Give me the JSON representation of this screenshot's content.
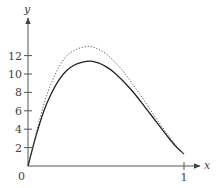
{
  "chart_data": {
    "type": "line",
    "title": "",
    "xlabel": "x",
    "ylabel": "y",
    "xlim": [
      0,
      1.1
    ],
    "ylim": [
      0,
      14
    ],
    "x_ticks": [
      {
        "value": 1,
        "label": "1"
      }
    ],
    "y_ticks": [
      {
        "value": 2,
        "label": "2"
      },
      {
        "value": 4,
        "label": "4"
      },
      {
        "value": 6,
        "label": "6"
      },
      {
        "value": 8,
        "label": "8"
      },
      {
        "value": 10,
        "label": "10"
      },
      {
        "value": 12,
        "label": "12"
      }
    ],
    "origin_label": "0",
    "grid": false,
    "legend": null,
    "series": [
      {
        "name": "solid curve",
        "style": "solid",
        "color": "#222222",
        "x": [
          0,
          0.05,
          0.1,
          0.15,
          0.2,
          0.25,
          0.3,
          0.35,
          0.4,
          0.45,
          0.5,
          0.55,
          0.6,
          0.65,
          0.7,
          0.75,
          0.8,
          0.85,
          0.9,
          0.95,
          1.0
        ],
        "y": [
          0,
          3.2,
          5.9,
          7.9,
          9.4,
          10.4,
          11.0,
          11.3,
          11.4,
          11.2,
          10.8,
          10.2,
          9.4,
          8.5,
          7.5,
          6.4,
          5.3,
          4.2,
          3.1,
          2.1,
          1.3
        ]
      },
      {
        "name": "dotted curve",
        "style": "dotted",
        "color": "#555555",
        "x": [
          0,
          0.05,
          0.1,
          0.15,
          0.2,
          0.25,
          0.3,
          0.35,
          0.4,
          0.45,
          0.5,
          0.55,
          0.6,
          0.65,
          0.7,
          0.75,
          0.8,
          0.85,
          0.9,
          0.95,
          1.0
        ],
        "y": [
          0,
          3.4,
          6.6,
          9.0,
          10.8,
          12.0,
          12.6,
          12.9,
          13.0,
          12.7,
          12.2,
          11.4,
          10.5,
          9.4,
          8.2,
          7.0,
          5.7,
          4.5,
          3.3,
          2.2,
          1.3
        ]
      }
    ]
  }
}
